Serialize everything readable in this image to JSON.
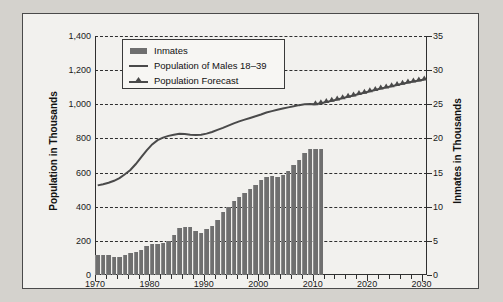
{
  "chart_data": {
    "type": "bar",
    "title": "",
    "subtitle": "",
    "xlabel": "",
    "ylabel": "Population in Thousands",
    "ylabel_right": "Inmates in Thousands",
    "xlim": [
      1970,
      2031
    ],
    "ylim": [
      0,
      1400
    ],
    "ylim_right": [
      0,
      35
    ],
    "grid": true,
    "legend_position": "top-center",
    "x_ticks": [
      "1970",
      "1980",
      "1990",
      "2000",
      "2010",
      "2020",
      "2030"
    ],
    "x_tick_values": [
      1970,
      1980,
      1990,
      2000,
      2010,
      2020,
      2030
    ],
    "y_ticks_left": [
      "0",
      "200",
      "400",
      "600",
      "800",
      "1,000",
      "1,200",
      "1,400"
    ],
    "y_tick_values_left": [
      0,
      200,
      400,
      600,
      800,
      1000,
      1200,
      1400
    ],
    "y_ticks_right": [
      "0",
      "5",
      "10",
      "15",
      "20",
      "25",
      "30",
      "35"
    ],
    "y_tick_values_right": [
      0,
      5,
      10,
      15,
      20,
      25,
      30,
      35
    ],
    "legend": [
      {
        "label": "Inmates",
        "marker": "bar",
        "color": "#6f6f6f"
      },
      {
        "label": "Population of Males 18–39",
        "marker": "line",
        "color": "#4a4a4a"
      },
      {
        "label": "Population Forecast",
        "marker": "line-triangle",
        "color": "#4a4a4a"
      }
    ],
    "series": [
      {
        "name": "Inmates",
        "type": "bar",
        "axis": "right",
        "units": "thousands of inmates",
        "x": [
          1970,
          1971,
          1972,
          1973,
          1974,
          1975,
          1976,
          1977,
          1978,
          1979,
          1980,
          1981,
          1982,
          1983,
          1984,
          1985,
          1986,
          1987,
          1988,
          1989,
          1990,
          1991,
          1992,
          1993,
          1994,
          1995,
          1996,
          1997,
          1998,
          1999,
          2000,
          2001,
          2002,
          2003,
          2004,
          2005,
          2006,
          2007,
          2008,
          2009,
          2010,
          2011
        ],
        "values": [
          3.0,
          3.0,
          2.9,
          2.7,
          2.6,
          2.9,
          3.2,
          3.4,
          3.7,
          4.3,
          4.5,
          4.5,
          4.7,
          5.0,
          5.8,
          6.9,
          7.0,
          7.0,
          6.5,
          6.2,
          6.8,
          7.2,
          8.0,
          9.3,
          10.0,
          10.8,
          11.4,
          12.0,
          12.6,
          13.2,
          13.9,
          14.3,
          14.5,
          14.3,
          14.7,
          15.3,
          16.1,
          16.8,
          17.9,
          18.4,
          18.5,
          18.5
        ],
        "values_left_scale": [
          120,
          120,
          116,
          108,
          104,
          116,
          128,
          136,
          148,
          172,
          180,
          180,
          188,
          200,
          232,
          276,
          280,
          280,
          260,
          248,
          272,
          288,
          320,
          372,
          400,
          432,
          456,
          480,
          504,
          528,
          556,
          572,
          580,
          572,
          588,
          612,
          644,
          672,
          716,
          736,
          740,
          740
        ]
      },
      {
        "name": "Population of Males 18–39",
        "type": "line",
        "axis": "left",
        "units": "thousands of people",
        "x": [
          1970,
          1971,
          1972,
          1973,
          1974,
          1975,
          1976,
          1977,
          1978,
          1979,
          1980,
          1981,
          1982,
          1983,
          1984,
          1985,
          1986,
          1987,
          1988,
          1989,
          1990,
          1991,
          1992,
          1993,
          1994,
          1995,
          1996,
          1997,
          1998,
          1999,
          2000,
          2001,
          2002,
          2003,
          2004,
          2005,
          2006,
          2007,
          2008,
          2009,
          2010
        ],
        "values": [
          525,
          532,
          540,
          552,
          568,
          590,
          615,
          650,
          690,
          730,
          765,
          790,
          805,
          815,
          822,
          828,
          826,
          822,
          820,
          822,
          828,
          838,
          850,
          862,
          875,
          888,
          900,
          910,
          920,
          930,
          940,
          952,
          960,
          968,
          975,
          982,
          988,
          995,
          1000,
          1002,
          1000
        ]
      },
      {
        "name": "Population Forecast",
        "type": "line-triangle",
        "axis": "left",
        "units": "thousands of people",
        "x": [
          2010,
          2011,
          2012,
          2013,
          2014,
          2015,
          2016,
          2017,
          2018,
          2019,
          2020,
          2021,
          2022,
          2023,
          2024,
          2025,
          2026,
          2027,
          2028,
          2029,
          2030
        ],
        "values": [
          1000,
          1006,
          1013,
          1020,
          1028,
          1036,
          1044,
          1052,
          1060,
          1068,
          1076,
          1084,
          1092,
          1099,
          1106,
          1113,
          1120,
          1127,
          1133,
          1139,
          1145
        ]
      }
    ]
  },
  "source": {
    "text": "SOURCE: “Prison Inmate Population,” December 28, 2011, Office of Financial Management, Washington. From http://www.ofm.wa.gov/trends/budget/fig408.asp."
  }
}
